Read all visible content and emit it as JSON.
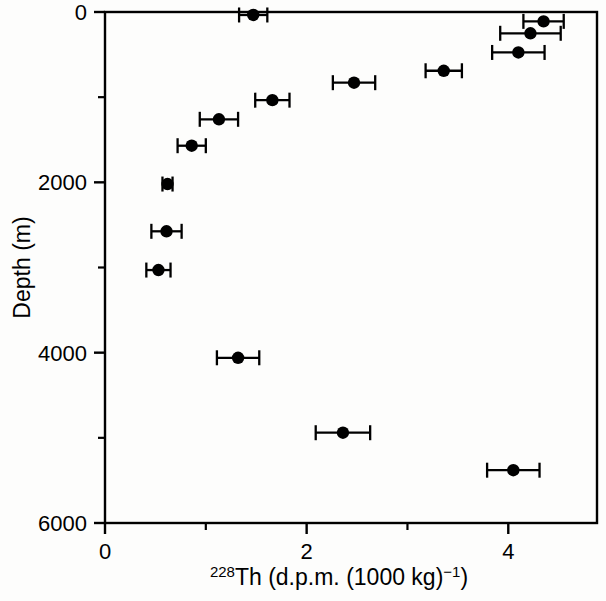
{
  "figure": {
    "background_color": "#fdfdfc",
    "ink_color": "#000000"
  },
  "axes": {
    "x": {
      "label_parts": {
        "isotope_superscript": "228",
        "element": "Th",
        "units_open": " (d.p.m. (1000 kg)",
        "units_exponent": "−1",
        "units_close": ")"
      },
      "label_plain": "228Th (d.p.m. (1000 kg)−1)",
      "ticks_major": [
        "0",
        "2",
        "4"
      ],
      "tick_values_major": [
        0,
        2,
        4
      ],
      "tick_values_minor": [
        1,
        3
      ],
      "range": [
        0,
        4.88
      ]
    },
    "y": {
      "label": "Depth (m)",
      "ticks_major": [
        "0",
        "2000",
        "4000",
        "6000"
      ],
      "tick_values_major": [
        0,
        2000,
        4000,
        6000
      ],
      "tick_values_minor": [
        1000,
        3000,
        5000
      ],
      "range": [
        0,
        6000
      ]
    }
  },
  "chart_data": {
    "type": "scatter",
    "title": "",
    "xlabel": "228Th (d.p.m. (1000 kg)−1)",
    "ylabel": "Depth (m)",
    "xlim": [
      0,
      4.88
    ],
    "ylim": [
      6000,
      0
    ],
    "y_axis_inverted": true,
    "grid": false,
    "legend": "none",
    "marker": "filled-circle",
    "error_bars": "horizontal-x",
    "series": [
      {
        "name": "228Th profile",
        "x": [
          1.47,
          4.35,
          4.22,
          4.1,
          3.36,
          2.47,
          1.66,
          1.13,
          0.86,
          0.62,
          0.61,
          0.53,
          1.32,
          2.36,
          4.05
        ],
        "y": [
          35,
          110,
          250,
          475,
          690,
          830,
          1035,
          1260,
          1570,
          2020,
          2575,
          3030,
          4060,
          4940,
          5380
        ],
        "xerr": [
          0.14,
          0.2,
          0.3,
          0.26,
          0.18,
          0.21,
          0.17,
          0.19,
          0.14,
          0.05,
          0.15,
          0.12,
          0.21,
          0.27,
          0.26
        ]
      }
    ],
    "points": [
      {
        "x": 1.47,
        "depth": 35,
        "xerr": 0.14
      },
      {
        "x": 4.35,
        "depth": 110,
        "xerr": 0.2
      },
      {
        "x": 4.22,
        "depth": 250,
        "xerr": 0.3
      },
      {
        "x": 4.1,
        "depth": 475,
        "xerr": 0.26
      },
      {
        "x": 3.36,
        "depth": 690,
        "xerr": 0.18
      },
      {
        "x": 2.47,
        "depth": 830,
        "xerr": 0.21
      },
      {
        "x": 1.66,
        "depth": 1035,
        "xerr": 0.17
      },
      {
        "x": 1.13,
        "depth": 1260,
        "xerr": 0.19
      },
      {
        "x": 0.86,
        "depth": 1570,
        "xerr": 0.14
      },
      {
        "x": 0.62,
        "depth": 2020,
        "xerr": 0.05
      },
      {
        "x": 0.61,
        "depth": 2575,
        "xerr": 0.15
      },
      {
        "x": 0.53,
        "depth": 3030,
        "xerr": 0.12
      },
      {
        "x": 1.32,
        "depth": 4060,
        "xerr": 0.21
      },
      {
        "x": 2.36,
        "depth": 4940,
        "xerr": 0.27
      },
      {
        "x": 4.05,
        "depth": 5380,
        "xerr": 0.26
      }
    ]
  },
  "geometry": {
    "plot_left": 105,
    "plot_right": 597,
    "plot_top": 12,
    "plot_bottom": 523,
    "px_per_x_unit": 100.7,
    "px_per_1000m": 84.2,
    "marker_radius": 6.2,
    "frame_stroke": 2.4,
    "tick_major_len": 11,
    "tick_minor_len": 7
  }
}
